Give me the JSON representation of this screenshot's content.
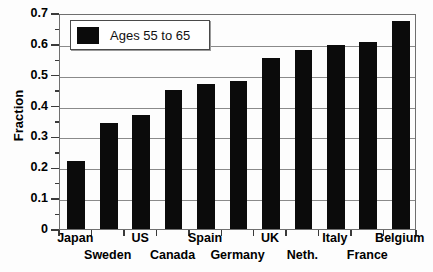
{
  "chart_data": {
    "type": "bar",
    "title": "",
    "xlabel": "",
    "ylabel": "Fraction",
    "categories": [
      "Japan",
      "Sweden",
      "US",
      "Canada",
      "Spain",
      "Germany",
      "UK",
      "Neth.",
      "Italy",
      "France",
      "Belgium"
    ],
    "values": [
      0.22,
      0.345,
      0.37,
      0.45,
      0.47,
      0.48,
      0.555,
      0.58,
      0.595,
      0.605,
      0.675
    ],
    "series": [
      {
        "name": "Ages 55 to 65",
        "values": [
          0.22,
          0.345,
          0.37,
          0.45,
          0.47,
          0.48,
          0.555,
          0.58,
          0.595,
          0.605,
          0.675
        ]
      }
    ],
    "ylim": [
      0,
      0.7
    ],
    "ytick_labels": [
      "0",
      "0.1",
      "0.2",
      "0.3",
      "0.4",
      "0.5",
      "0.6",
      "0.7"
    ],
    "ytick_values": [
      0,
      0.1,
      0.2,
      0.3,
      0.4,
      0.5,
      0.6,
      0.7
    ],
    "yminor_values": [
      0.05,
      0.15,
      0.25,
      0.35,
      0.45,
      0.55,
      0.65
    ],
    "grid": "horizontal",
    "legend_position": "upper-left",
    "bar_color": "#0b0b0b",
    "label_rows": [
      0,
      1,
      0,
      1,
      0,
      1,
      0,
      1,
      0,
      1,
      0
    ]
  },
  "legend": {
    "label": "Ages 55 to 65"
  }
}
